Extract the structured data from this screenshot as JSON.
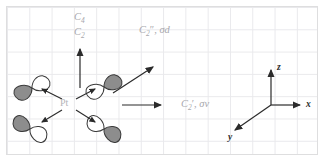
{
  "figure": {
    "type": "symmetry-element-diagram",
    "grid": {
      "visible": true,
      "cell_px": 22.3,
      "line_color": "#e9e9ec",
      "border_color": "#dededf"
    },
    "colors": {
      "grid_line": "#e9e9ec",
      "panel_border": "#dededf",
      "label_gray": "#a8a8ad",
      "metal_gray": "#b4b4b9",
      "arrow_dark": "#2b2b2b",
      "lobe_fill": "#8d8d8d",
      "lobe_stroke": "#3a3a3a",
      "lobe_white": "#ffffff"
    }
  },
  "molecule": {
    "center_label": "Pt",
    "orbital_count": 4,
    "orbital_description": "dumbbell p-type lobe pair, one lobe shaded gray, one lobe white"
  },
  "symmetry_labels": [
    {
      "id": "c4",
      "text": "C4",
      "base": "C",
      "sub": "4",
      "prime": "",
      "extra": "",
      "x": 74,
      "y": 12
    },
    {
      "id": "c2-principal",
      "text": "C2",
      "base": "C",
      "sub": "2",
      "prime": "",
      "extra": "",
      "x": 74,
      "y": 27
    },
    {
      "id": "c2pp-sigmad",
      "text": "C2″, σd",
      "base": "C",
      "sub": "2",
      "prime": "″",
      "extra": ", σd",
      "x": 139,
      "y": 25
    },
    {
      "id": "c2p-sigmav",
      "text": "C2′, σv",
      "base": "C",
      "sub": "2",
      "prime": "′",
      "extra": ", σv",
      "x": 181,
      "y": 99
    }
  ],
  "axes": [
    {
      "id": "z",
      "label": "z",
      "direction": "up",
      "label_x": 277,
      "label_y": 63
    },
    {
      "id": "x",
      "label": "x",
      "direction": "right",
      "label_x": 306,
      "label_y": 100
    },
    {
      "id": "y",
      "label": "y",
      "direction": "down-left",
      "label_x": 228,
      "label_y": 133
    }
  ],
  "operation_arrows": [
    {
      "id": "c4-axis-arrow",
      "from": [
        80,
        88
      ],
      "to": [
        80,
        47
      ],
      "label_ref": "c4"
    },
    {
      "id": "c2pp-arrow",
      "from": [
        113,
        93
      ],
      "to": [
        155,
        66
      ],
      "label_ref": "c2pp-sigmad"
    },
    {
      "id": "c2p-arrow",
      "from": [
        122,
        105
      ],
      "to": [
        163,
        105
      ],
      "label_ref": "c2p-sigmav"
    }
  ],
  "bond_arrows": [
    {
      "id": "bond-upper-left",
      "from": [
        62,
        99
      ],
      "to": [
        40,
        88
      ]
    },
    {
      "id": "bond-upper-right",
      "from": [
        76,
        99
      ],
      "to": [
        97,
        88
      ]
    },
    {
      "id": "bond-lower-left",
      "from": [
        62,
        110
      ],
      "to": [
        40,
        123
      ]
    },
    {
      "id": "bond-lower-right",
      "from": [
        76,
        110
      ],
      "to": [
        97,
        123
      ]
    }
  ]
}
